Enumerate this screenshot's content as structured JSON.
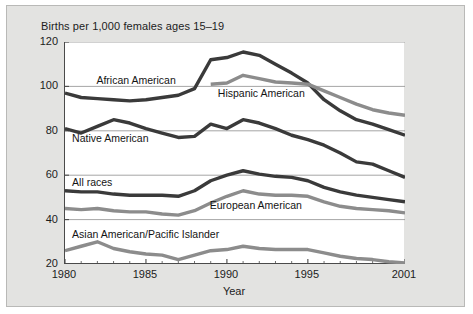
{
  "figure": {
    "background_color": "#e3e3e1",
    "plot_background_color": "#ffffff"
  },
  "chart_data": {
    "type": "line",
    "title": "Births per 1,000 females ages 15–19",
    "xlabel": "Year",
    "ylabel": "",
    "xlim": [
      1980,
      2001
    ],
    "ylim": [
      20,
      120
    ],
    "grid": "horizontal",
    "legend": "inline-labels",
    "xticks": [
      "1980",
      "1985",
      "1990",
      "1995",
      "2001"
    ],
    "xtick_values": [
      1980,
      1985,
      1990,
      1995,
      2001
    ],
    "yticks": [
      "20",
      "40",
      "60",
      "80",
      "100",
      "120"
    ],
    "ytick_values": [
      20,
      40,
      60,
      80,
      100,
      120
    ],
    "x": [
      1980,
      1981,
      1982,
      1983,
      1984,
      1985,
      1986,
      1987,
      1988,
      1989,
      1990,
      1991,
      1992,
      1993,
      1994,
      1995,
      1996,
      1997,
      1998,
      1999,
      2000,
      2001
    ],
    "series": [
      {
        "name": "African American",
        "color": "#3a3a3a",
        "label_x": 1982.0,
        "label_y": 102.5,
        "values": [
          97,
          95,
          94.5,
          94,
          93.5,
          94,
          95,
          96,
          99,
          112,
          113,
          115.5,
          114,
          110,
          106,
          101.5,
          94,
          89,
          85,
          83,
          80.5,
          78
        ]
      },
      {
        "name": "Hispanic American",
        "color": "#8c8c8c",
        "label_x": 1989.5,
        "label_y": 96.5,
        "values": [
          null,
          null,
          null,
          null,
          null,
          null,
          null,
          null,
          null,
          101,
          101.5,
          105,
          103.5,
          102,
          101.5,
          101,
          98,
          95,
          92,
          89.5,
          88,
          87
        ]
      },
      {
        "name": "Native American",
        "color": "#3a3a3a",
        "label_x": 1980.5,
        "label_y": 76.5,
        "values": [
          81,
          79,
          82,
          85,
          83.5,
          81,
          79,
          77,
          77.5,
          83,
          81,
          85,
          83.5,
          81,
          78,
          76,
          73.5,
          70,
          66,
          65,
          62,
          59
        ]
      },
      {
        "name": "All races",
        "color": "#3a3a3a",
        "label_x": 1980.5,
        "label_y": 56.5,
        "values": [
          53,
          52.5,
          52.5,
          51.5,
          51,
          51,
          51,
          50.5,
          53,
          57.5,
          60,
          62,
          60.5,
          59.5,
          59,
          57.5,
          54.5,
          52.5,
          51,
          50,
          49,
          48
        ]
      },
      {
        "name": "European American",
        "color": "#8c8c8c",
        "label_x": 1989.0,
        "label_y": 46.0,
        "values": [
          45,
          44.5,
          45,
          44,
          43.5,
          43.5,
          42.5,
          42,
          44,
          47.5,
          50.5,
          53,
          51.5,
          51,
          51,
          50.5,
          48,
          46,
          45,
          44.5,
          44,
          43
        ]
      },
      {
        "name": "Asian American/Pacific Islander",
        "color": "#8c8c8c",
        "label_x": 1980.5,
        "label_y": 33.0,
        "values": [
          26,
          28,
          30,
          27,
          25.5,
          24.5,
          24,
          22,
          24,
          26,
          26.5,
          28,
          27,
          26.5,
          26.5,
          26.5,
          25,
          23.5,
          22.5,
          22,
          21,
          20.5
        ]
      }
    ]
  }
}
